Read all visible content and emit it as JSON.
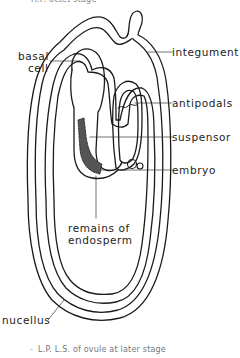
{
  "figure": {
    "top_caption": "H.P. octet stage",
    "bottom_caption_prefix": "-",
    "bottom_caption": "L.P. L.S. of ovule at later stage"
  },
  "labels": {
    "basal_line1": "basal",
    "basal_line2": "cell",
    "integument": "integument",
    "antipodals": "antipodals",
    "suspensor": "suspensor",
    "embryo": "embryo",
    "endosperm_line1": "remains of",
    "endosperm_line2": "endosperm",
    "nucellus": "nucellus"
  },
  "colors": {
    "line": "#1a1a1a",
    "caption": "#888888"
  }
}
